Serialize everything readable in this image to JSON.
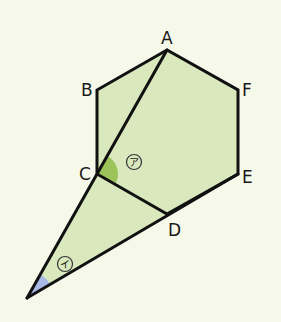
{
  "figure": {
    "background_color": "#f6f8ea",
    "shape_fill_color": "#d9e9bd",
    "line_color": "#111111",
    "vertices": {
      "A": {
        "label": "A",
        "x": 167,
        "y": 50
      },
      "B": {
        "label": "B",
        "x": 97,
        "y": 90
      },
      "C": {
        "label": "C",
        "x": 97,
        "y": 174
      },
      "D": {
        "label": "D",
        "x": 167,
        "y": 214
      },
      "E": {
        "label": "E",
        "x": 238,
        "y": 174
      },
      "F": {
        "label": "F",
        "x": 238,
        "y": 90
      },
      "P": {
        "label": "",
        "x": 27,
        "y": 298
      }
    },
    "segments": [
      "AB",
      "BC",
      "CD",
      "DE",
      "EF",
      "FA",
      "AC",
      "CP",
      "DP"
    ],
    "angles": [
      {
        "id": "angle-a",
        "mark": "ア",
        "at": "C",
        "between": [
          "CA",
          "CD"
        ],
        "fill_color": "#9cc45a"
      },
      {
        "id": "angle-i",
        "mark": "イ",
        "at": "P",
        "between": [
          "PC",
          "PD"
        ],
        "fill_color": "#a9b9e6"
      }
    ]
  }
}
